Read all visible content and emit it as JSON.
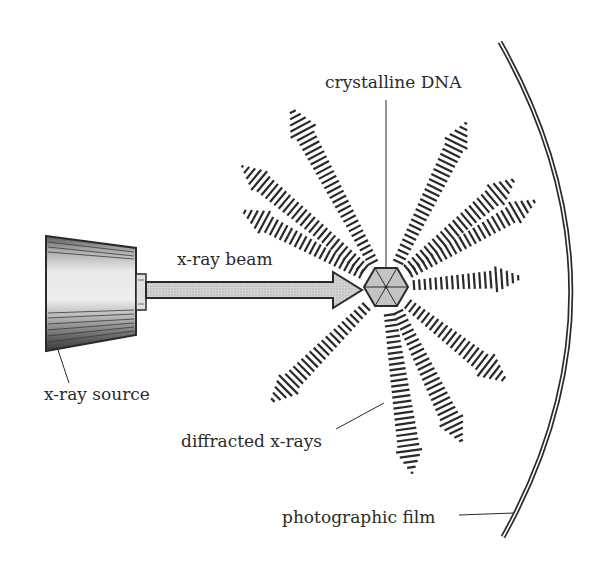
{
  "diagram": {
    "labels": {
      "crystalline_dna": "crystalline DNA",
      "xray_beam": "x-ray beam",
      "xray_source": "x-ray source",
      "diffracted_xrays": "diffracted x-rays",
      "photographic_film": "photographic film"
    },
    "components": [
      {
        "id": "xray-source",
        "label": "x-ray source",
        "shape": "truncated-cone"
      },
      {
        "id": "xray-beam",
        "label": "x-ray beam",
        "shape": "arrow"
      },
      {
        "id": "crystalline-dna",
        "label": "crystalline DNA",
        "shape": "hexagon"
      },
      {
        "id": "diffracted-xrays",
        "label": "diffracted x-rays",
        "shape": "hatched-arrows",
        "count": 11
      },
      {
        "id": "photographic-film",
        "label": "photographic film",
        "shape": "arc"
      }
    ],
    "colors": {
      "ink": "#2a2a2a",
      "fill_gray": "#c8c8c8",
      "source_light": "#e6e6e6",
      "background": "#ffffff"
    }
  }
}
